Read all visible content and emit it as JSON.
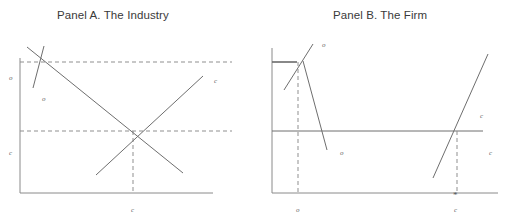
{
  "figure": {
    "panel_a": {
      "title": "Panel A. The Industry",
      "labels": {
        "y_top": "o",
        "demand": "o",
        "y_mid": "c",
        "supply": "c",
        "x_axis": "c"
      }
    },
    "panel_b": {
      "title": "Panel B. The Firm",
      "labels": {
        "upper_curve": "o",
        "lower_curve": "o",
        "x_left": "o",
        "right_upper": "c",
        "right_lower": "c",
        "x_right": "c",
        "star_marker": "*"
      }
    }
  }
}
